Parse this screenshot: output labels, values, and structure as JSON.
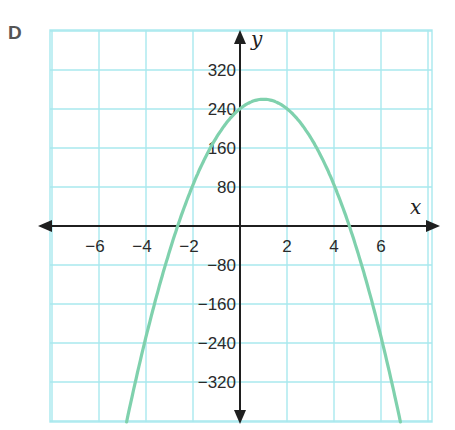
{
  "panel_label": "D",
  "chart_data": {
    "type": "line",
    "title": "",
    "xlabel": "x",
    "ylabel": "y",
    "xlim": [
      -8.2,
      8.0
    ],
    "ylim": [
      -400,
      400
    ],
    "grid": true,
    "x_ticks": [
      -6,
      -4,
      -2,
      2,
      4,
      6
    ],
    "x_tick_labels": [
      "−6",
      "−4",
      "−2",
      "2",
      "4",
      "6"
    ],
    "y_ticks": [
      320,
      240,
      160,
      80,
      -80,
      -160,
      -240,
      -320
    ],
    "y_tick_labels": [
      "320",
      "240",
      "160",
      "80",
      "−80",
      "−160",
      "−240",
      "−320"
    ],
    "series": [
      {
        "name": "parabola",
        "equation_approx": "y = -19.5(x - 1)^2 + 260",
        "vertex": [
          1,
          260
        ],
        "x_intercepts": [
          -2.7,
          4.6
        ],
        "y_intercept": 240,
        "x": [
          -4.8,
          -4,
          -3,
          -2.7,
          -2,
          -1,
          0,
          1,
          2,
          3,
          4,
          4.6,
          5,
          6,
          6.9
        ],
        "y": [
          -402,
          -228,
          -52,
          0,
          84,
          182,
          240,
          260,
          240,
          182,
          84,
          0,
          -52,
          -228,
          -402
        ],
        "color": "#7fd1ad"
      }
    ]
  },
  "colors": {
    "grid": "#a8e8ee",
    "axis": "#1f1f1f",
    "curve": "#7fd1ad"
  }
}
